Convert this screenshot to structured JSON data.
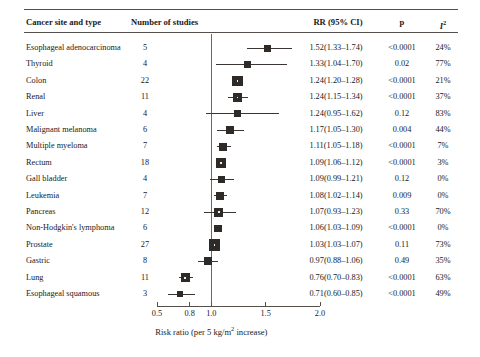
{
  "header": {
    "site_label": "Cancer site and type",
    "nstudies_label": "Number of studies",
    "rr_label": "RR (95% CI)",
    "p_label": "p",
    "i2_label": "I",
    "i2_sup": "2"
  },
  "axis": {
    "title_main": "Risk ratio (per 5 kg/m",
    "title_sup": "2",
    "title_tail": " increase)",
    "ticks": [
      "0.5",
      "0.8",
      "1.0",
      "1.5",
      "2.0"
    ],
    "tick_values": [
      0.5,
      0.8,
      1.0,
      1.5,
      2.0
    ],
    "reference_value": 1.0,
    "xlim": [
      0.45,
      2.05
    ]
  },
  "chart_data": {
    "type": "forest",
    "title": "",
    "xlabel": "Risk ratio (per 5 kg/m2 increase)",
    "ylabel": "",
    "xlim": [
      0.45,
      2.05
    ],
    "reference_line": 1.0,
    "grid": false,
    "axis_ticks": [
      0.5,
      0.8,
      1.0,
      1.5,
      2.0
    ],
    "columns": [
      "Cancer site and type",
      "Number of studies",
      "RR (95% CI)",
      "p",
      "I2"
    ],
    "rows": [
      {
        "site": "Esophageal adenocarcinoma",
        "n": "5",
        "n_val": 5,
        "rr": "1.52(1.33–1.74)",
        "est": 1.52,
        "lo": 1.33,
        "hi": 1.74,
        "p": "<0.0001",
        "i2": "24%"
      },
      {
        "site": "Thyroid",
        "n": "4",
        "n_val": 4,
        "rr": "1.33(1.04–1.70)",
        "est": 1.33,
        "lo": 1.04,
        "hi": 1.7,
        "p": "0.02",
        "i2": "77%"
      },
      {
        "site": "Colon",
        "n": "22",
        "n_val": 22,
        "rr": "1.24(1.20–1.28)",
        "est": 1.24,
        "lo": 1.2,
        "hi": 1.28,
        "p": "<0.0001",
        "i2": "21%"
      },
      {
        "site": "Renal",
        "n": "11",
        "n_val": 11,
        "rr": "1.24(1.15–1.34)",
        "est": 1.24,
        "lo": 1.15,
        "hi": 1.34,
        "p": "<0.0001",
        "i2": "37%"
      },
      {
        "site": "Liver",
        "n": "4",
        "n_val": 4,
        "rr": "1.24(0.95–1.62)",
        "est": 1.24,
        "lo": 0.95,
        "hi": 1.62,
        "p": "0.12",
        "i2": "83%"
      },
      {
        "site": "Malignant melanoma",
        "n": "6",
        "n_val": 6,
        "rr": "1.17(1.05–1.30)",
        "est": 1.17,
        "lo": 1.05,
        "hi": 1.3,
        "p": "0.004",
        "i2": "44%"
      },
      {
        "site": "Multiple myeloma",
        "n": "7",
        "n_val": 7,
        "rr": "1.11(1.05–1.18)",
        "est": 1.11,
        "lo": 1.05,
        "hi": 1.18,
        "p": "<0.0001",
        "i2": "7%"
      },
      {
        "site": "Rectum",
        "n": "18",
        "n_val": 18,
        "rr": "1.09(1.06–1.12)",
        "est": 1.09,
        "lo": 1.06,
        "hi": 1.12,
        "p": "<0.0001",
        "i2": "3%"
      },
      {
        "site": "Gall bladder",
        "n": "4",
        "n_val": 4,
        "rr": "1.09(0.99–1.21)",
        "est": 1.09,
        "lo": 0.99,
        "hi": 1.21,
        "p": "0.12",
        "i2": "0%"
      },
      {
        "site": "Leukemia",
        "n": "7",
        "n_val": 7,
        "rr": "1.08(1.02–1.14)",
        "est": 1.08,
        "lo": 1.02,
        "hi": 1.14,
        "p": "0.009",
        "i2": "0%"
      },
      {
        "site": "Pancreas",
        "n": "12",
        "n_val": 12,
        "rr": "1.07(0.93–1.23)",
        "est": 1.07,
        "lo": 0.93,
        "hi": 1.23,
        "p": "0.33",
        "i2": "70%"
      },
      {
        "site": "Non-Hodgkin's lymphoma",
        "n": "6",
        "n_val": 6,
        "rr": "1.06(1.03–1.09)",
        "est": 1.06,
        "lo": 1.03,
        "hi": 1.09,
        "p": "<0.0001",
        "i2": "0%"
      },
      {
        "site": "Prostate",
        "n": "27",
        "n_val": 27,
        "rr": "1.03(1.03–1.07)",
        "est": 1.03,
        "lo": 1.0,
        "hi": 1.07,
        "p": "0.11",
        "i2": "73%"
      },
      {
        "site": "Gastric",
        "n": "8",
        "n_val": 8,
        "rr": "0.97(0.88–1.06)",
        "est": 0.97,
        "lo": 0.88,
        "hi": 1.06,
        "p": "0.49",
        "i2": "35%"
      },
      {
        "site": "Lung",
        "n": "11",
        "n_val": 11,
        "rr": "0.76(0.70–0.83)",
        "est": 0.76,
        "lo": 0.7,
        "hi": 0.83,
        "p": "<0.0001",
        "i2": "63%"
      },
      {
        "site": "Esophageal squamous",
        "n": "3",
        "n_val": 3,
        "rr": "0.71(0.60–0.85)",
        "est": 0.71,
        "lo": 0.6,
        "hi": 0.85,
        "p": "<0.0001",
        "i2": "49%"
      }
    ]
  },
  "colors": {
    "marker": "#2e2a27",
    "rule": "#55504c",
    "reference_line": "#6d6762",
    "text": "#1a1a1a",
    "background": "#ffffff"
  }
}
